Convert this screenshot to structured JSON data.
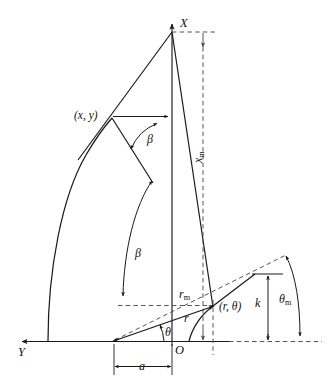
{
  "figure": {
    "kind": "geometry-diagram",
    "background_color": "#ffffff",
    "stroke_color": "#1a1a1a",
    "dashed_color": "#555555",
    "labels": {
      "axis_x": "X",
      "axis_y": "Y",
      "origin": "O",
      "point_xy": "(x, y)",
      "point_rtheta": "(r, θ)",
      "beta_upper": "β",
      "beta_lower": "β",
      "theta": "θ",
      "theta_m_base": "θ",
      "theta_m_sub": "m",
      "x_m_base": "x",
      "x_m_sub": "m",
      "r_m_base": "r",
      "r_m_sub": "m",
      "r": "r",
      "k": "k",
      "a": "a"
    },
    "annotations": [
      {
        "name": "x-axis-label",
        "text": "X"
      },
      {
        "name": "y-axis-label",
        "text": "Y"
      },
      {
        "name": "origin-label",
        "text": "O"
      },
      {
        "name": "point-xy-label",
        "text": "(x, y)"
      },
      {
        "name": "point-r-theta-label",
        "text": "(r, θ)"
      },
      {
        "name": "beta-upper-label",
        "text": "β"
      },
      {
        "name": "beta-lower-label",
        "text": "β"
      },
      {
        "name": "theta-label",
        "text": "θ"
      },
      {
        "name": "theta-m-label",
        "text": "θm"
      },
      {
        "name": "x-m-label",
        "text": "xm"
      },
      {
        "name": "r-m-label",
        "text": "rm"
      },
      {
        "name": "r-label",
        "text": "r"
      },
      {
        "name": "k-label",
        "text": "k"
      },
      {
        "name": "a-label",
        "text": "a"
      }
    ]
  }
}
